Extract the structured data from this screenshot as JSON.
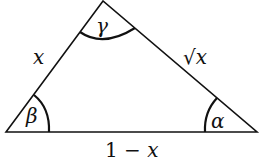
{
  "diagram": {
    "type": "triangle",
    "vertices": {
      "left": {
        "x": 6,
        "y": 132
      },
      "top": {
        "x": 103,
        "y": 1
      },
      "right": {
        "x": 257,
        "y": 132
      }
    },
    "sides": {
      "left": {
        "label": "x"
      },
      "right": {
        "label_radical": "√",
        "label_var": "x"
      },
      "base": {
        "label_num": "1 − ",
        "label_var": "x"
      }
    },
    "angles": {
      "top": {
        "label": "γ"
      },
      "left": {
        "label": "β"
      },
      "right": {
        "label": "α"
      }
    },
    "stroke_color": "#111111"
  }
}
